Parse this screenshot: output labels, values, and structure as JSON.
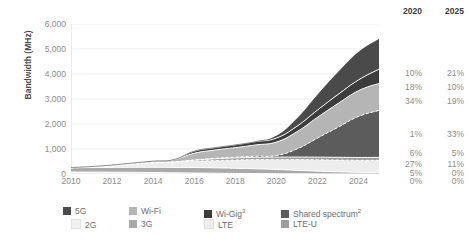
{
  "chart_data": {
    "type": "area",
    "stacked": true,
    "title": "",
    "xlabel": "",
    "ylabel": "Bandwidth (MHz)",
    "ylim": [
      0,
      6000
    ],
    "xlim": [
      2010,
      2025
    ],
    "grid": true,
    "legend_position": "bottom",
    "y_ticks": [
      "0",
      "1,000",
      "2,000",
      "3,000",
      "4,000",
      "5,000",
      "6,000"
    ],
    "y_tick_values": [
      0,
      1000,
      2000,
      3000,
      4000,
      5000,
      6000
    ],
    "x_ticks": [
      "2010",
      "2012",
      "2014",
      "2016",
      "2018",
      "2020",
      "2022",
      "2024"
    ],
    "x_tick_values": [
      2010,
      2012,
      2014,
      2016,
      2018,
      2020,
      2022,
      2024
    ],
    "x": [
      2010,
      2011,
      2012,
      2013,
      2014,
      2015,
      2016,
      2017,
      2018,
      2019,
      2020,
      2021,
      2022,
      2023,
      2024,
      2025
    ],
    "series": [
      {
        "name": "2G",
        "color": "#f0f0f0",
        "values": [
          80,
          78,
          74,
          68,
          60,
          50,
          40,
          32,
          24,
          18,
          12,
          8,
          5,
          3,
          2,
          0
        ]
      },
      {
        "name": "3G",
        "color": "#a9a9a9",
        "values": [
          170,
          180,
          190,
          200,
          210,
          215,
          220,
          215,
          205,
          190,
          170,
          140,
          110,
          85,
          65,
          55
        ]
      },
      {
        "name": "LTE",
        "color": "#ededed",
        "values": [
          0,
          20,
          60,
          120,
          175,
          215,
          250,
          290,
          330,
          370,
          400,
          430,
          455,
          470,
          480,
          490
        ]
      },
      {
        "name": "LTE-U",
        "color": "#9e9e9e",
        "values": [
          0,
          0,
          0,
          0,
          0,
          0,
          40,
          70,
          85,
          90,
          95,
          100,
          105,
          110,
          115,
          120
        ]
      },
      {
        "name": "Shared spectrum",
        "color": "#5c5c5c",
        "values": [
          0,
          0,
          0,
          0,
          0,
          0,
          10,
          20,
          30,
          45,
          60,
          320,
          760,
          1200,
          1640,
          1880
        ]
      },
      {
        "name": "Wi-Fi",
        "color": "#b5b5b5",
        "values": [
          10,
          20,
          35,
          50,
          70,
          95,
          270,
          330,
          380,
          450,
          540,
          690,
          830,
          950,
          1030,
          1080
        ]
      },
      {
        "name": "Wi-Gig",
        "color": "#3c3c3c",
        "values": [
          0,
          0,
          0,
          0,
          0,
          0,
          80,
          95,
          110,
          130,
          160,
          220,
          290,
          360,
          430,
          570
        ]
      },
      {
        "name": "5G",
        "color": "#4a4a4a",
        "values": [
          0,
          0,
          0,
          0,
          0,
          0,
          0,
          0,
          0,
          0,
          80,
          300,
          600,
          880,
          1110,
          1195
        ]
      }
    ],
    "totals": [
      260,
      298,
      359,
      438,
      515,
      575,
      910,
      1052,
      1164,
      1293,
      1517,
      2208,
      3155,
      4058,
      4872,
      5390
    ],
    "annotations": {
      "share_table": {
        "columns": [
          "2020",
          "2025"
        ],
        "rows": [
          {
            "series": "5G",
            "2020": "10%",
            "2025": "21%"
          },
          {
            "series": "Wi-Gig",
            "2020": "18%",
            "2025": "10%"
          },
          {
            "series": "Wi-Fi",
            "2020": "34%",
            "2025": "19%"
          },
          {
            "series": "Shared spectrum",
            "2020": "1%",
            "2025": "33%"
          },
          {
            "series": "LTE-U",
            "2020": "6%",
            "2025": "5%"
          },
          {
            "series": "LTE",
            "2020": "27%",
            "2025": "11%"
          },
          {
            "series": "3G",
            "2020": "5%",
            "2025": "0%"
          },
          {
            "series": "2G",
            "2020": "0%",
            "2025": "0%"
          }
        ]
      }
    }
  },
  "axis": {
    "y_title": "Bandwidth (MHz)"
  },
  "share_table": {
    "header_2020": "2020",
    "header_2025": "2025",
    "rows": [
      {
        "a": "10%",
        "b": "21%",
        "top": 62
      },
      {
        "a": "18%",
        "b": "10%",
        "top": 76
      },
      {
        "a": "34%",
        "b": "19%",
        "top": 90
      },
      {
        "a": "1%",
        "b": "33%",
        "top": 123
      },
      {
        "a": "6%",
        "b": "5%",
        "top": 142
      },
      {
        "a": "27%",
        "b": "11%",
        "top": 153
      },
      {
        "a": "5%",
        "b": "0%",
        "top": 162
      },
      {
        "a": "0%",
        "b": "0%",
        "top": 170
      }
    ]
  },
  "legend": {
    "items": [
      {
        "label": "5G",
        "sup": "",
        "color": "#4a4a4a",
        "col": 0,
        "row": 0
      },
      {
        "label": "Wi-Fi",
        "sup": "",
        "color": "#b5b5b5",
        "col": 1,
        "row": 0
      },
      {
        "label": "Wi-Gig",
        "sup": "3",
        "color": "#3c3c3c",
        "col": 2,
        "row": 0
      },
      {
        "label": "Shared spectrum",
        "sup": "2",
        "color": "#5c5c5c",
        "col": 3,
        "row": 0
      },
      {
        "label": "2G",
        "sup": "",
        "color": "#f0f0f0",
        "col": 0,
        "row": 1
      },
      {
        "label": "3G",
        "sup": "",
        "color": "#a9a9a9",
        "col": 1,
        "row": 1
      },
      {
        "label": "LTE",
        "sup": "",
        "color": "#ededed",
        "col": 2,
        "row": 1
      },
      {
        "label": "LTE-U",
        "sup": "",
        "color": "#9e9e9e",
        "col": 3,
        "row": 1
      }
    ]
  }
}
